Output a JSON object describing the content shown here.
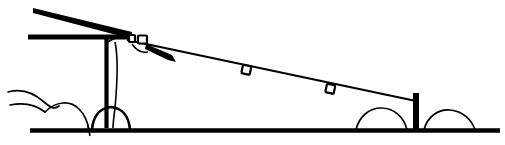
{
  "figure": {
    "title": "Utility pole with descending overhead wire",
    "style": "black-and-white line drawing",
    "canvas": {
      "width": 505,
      "height": 145
    },
    "colors": {
      "ink": "#000000",
      "paper": "#ffffff"
    },
    "parts": {
      "upper_boom_label": "upper diagonal boom",
      "crossarm_label": "horizontal crossarm",
      "pole_label": "vertical utility pole",
      "pole_base_label": "pole base mound",
      "wire_label": "descending overhead wire",
      "insulator_label": "insulator block",
      "strain_clamp_label": "strain clamp",
      "bead_1_label": "wire bead marker one",
      "bead_2_label": "wire bead marker two",
      "end_post_label": "short terminating post",
      "ground_label": "ground line",
      "left_bush_label": "left bush outline",
      "right_bush_left_label": "right bush left mound",
      "right_bush_right_label": "right bush right mound"
    },
    "geometry": {
      "ground_y": 130,
      "ground_x_start": 30,
      "ground_x_end": 500,
      "pole_x": 108,
      "pole_top_y": 36,
      "pole_bottom_y": 128,
      "wire_start": {
        "x": 126,
        "y": 40
      },
      "wire_end": {
        "x": 416,
        "y": 101
      },
      "bead_1": {
        "x": 246,
        "y": 70
      },
      "bead_2": {
        "x": 330,
        "y": 89
      },
      "end_post": {
        "x": 416,
        "y_top": 93,
        "y_bottom": 130
      },
      "crossarm": {
        "x_start": 28,
        "x_end": 130,
        "y": 37
      },
      "boom": {
        "x_start": 33,
        "y_start": 10,
        "x_end": 131,
        "y_end": 36
      }
    }
  }
}
